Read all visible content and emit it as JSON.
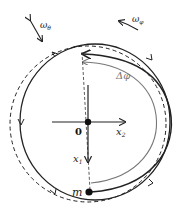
{
  "diagram": {
    "labels": {
      "omega_theta": "ω",
      "omega_theta_sub": "θ",
      "omega_phi": "ω",
      "omega_phi_sub": "φ",
      "delta_phi": "Δφ",
      "origin": "0",
      "x1": "x",
      "x1_sub": "1",
      "x2": "x",
      "x2_sub": "2",
      "mass": "m"
    },
    "colors": {
      "stroke": "#222222",
      "grey": "#777777",
      "background": "#ffffff"
    }
  }
}
